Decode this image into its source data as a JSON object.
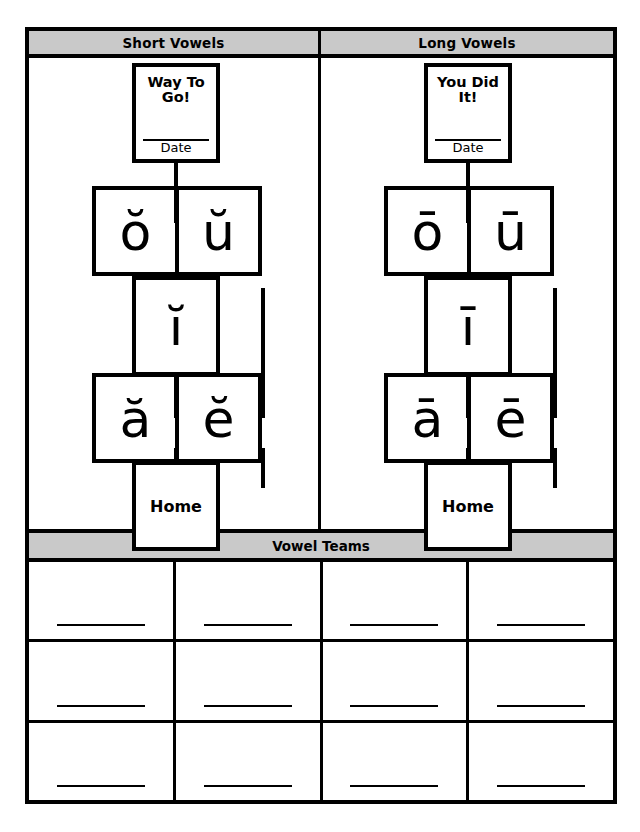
{
  "worksheet": {
    "title": "Vowel Baseball Worksheet"
  },
  "panels": [
    {
      "id": "short-vowels",
      "header": "Short Vowels",
      "award": {
        "title": "Way To Go!",
        "date_label": "Date"
      },
      "second_base": [
        "ŏ",
        "ŭ"
      ],
      "third_base": "ĭ",
      "first_base": [
        "ă",
        "ĕ"
      ],
      "home": "Home"
    },
    {
      "id": "long-vowels",
      "header": "Long Vowels",
      "award": {
        "title": "You Did It!",
        "date_label": "Date"
      },
      "second_base": [
        "ō",
        "ū"
      ],
      "third_base": "ī",
      "first_base": [
        "ā",
        "ē"
      ],
      "home": "Home"
    }
  ],
  "teams": {
    "header": "Vowel Teams",
    "rows": 3,
    "columns": 4,
    "cells": [
      [
        "",
        "",
        "",
        ""
      ],
      [
        "",
        "",
        "",
        ""
      ],
      [
        "",
        "",
        "",
        ""
      ]
    ]
  },
  "colors": {
    "ink": "#000000",
    "header_band": "#c9c9c9",
    "paper": "#ffffff"
  }
}
